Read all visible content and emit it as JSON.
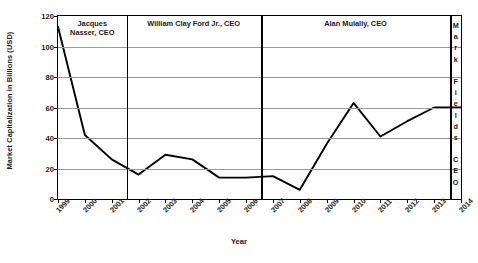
{
  "chart_data": {
    "type": "line",
    "title": "",
    "xlabel": "Year",
    "ylabel": "Market Capitalization in Billions (USD)",
    "categories": [
      "1999",
      "2000",
      "2001",
      "2002",
      "2003",
      "2004",
      "2005",
      "2006",
      "2007",
      "2008",
      "2009",
      "2010",
      "2011",
      "2012",
      "2013",
      "2014"
    ],
    "values": [
      113,
      42,
      26,
      16,
      29,
      26,
      14,
      14,
      15,
      6,
      36,
      63,
      41,
      51,
      60,
      60
    ],
    "series": [
      {
        "name": "Market Capitalization",
        "values": [
          113,
          42,
          26,
          16,
          29,
          26,
          14,
          14,
          15,
          6,
          36,
          63,
          41,
          51,
          60,
          60
        ]
      }
    ],
    "ylim": [
      0,
      120
    ],
    "yticks": [
      0,
      20,
      40,
      60,
      80,
      100,
      120
    ],
    "xlim": [
      "1999",
      "2014"
    ],
    "grid": "horizontal",
    "legend": "none",
    "line_color": "#000000",
    "grid_color": "#9a9a9a",
    "annotations": [
      {
        "label": "Jacques\nNasser, CEO",
        "display": "Jacques|Nasser, CEO",
        "orientation": "horizontal",
        "start": "1999",
        "end": "2001"
      },
      {
        "label": "William Clay Ford Jr., CEO",
        "display": "William Clay Ford Jr., CEO",
        "orientation": "horizontal",
        "start": "2001",
        "end": "2006"
      },
      {
        "label": "Alan Mulally, CEO",
        "display": "Alan Mulally, CEO",
        "orientation": "horizontal",
        "start": "2006",
        "end": "2013"
      },
      {
        "label": "Mark Fields, CEO",
        "display": "M|a|r|k| |F|i|e|l|d|s| |C|E|O",
        "orientation": "vertical",
        "start": "2013",
        "end": "2014"
      }
    ]
  },
  "axes": {
    "y_title": "Market Capitalization in Billions (USD)",
    "x_title": "Year",
    "y_ticks": [
      "0",
      "20",
      "40",
      "60",
      "80",
      "100",
      "120"
    ],
    "x_ticks": [
      "1999",
      "2000",
      "2001",
      "2002",
      "2003",
      "2004",
      "2005",
      "2006",
      "2007",
      "2008",
      "2009",
      "2010",
      "2011",
      "2012",
      "2013",
      "2014"
    ]
  },
  "ceo_segments": [
    {
      "id": "nasser",
      "line1": "Jacques",
      "line2": "Nasser, CEO"
    },
    {
      "id": "ford",
      "line1": "William Clay Ford Jr., CEO",
      "line2": ""
    },
    {
      "id": "mulally",
      "line1": "Alan Mulally, CEO",
      "line2": ""
    },
    {
      "id": "fields",
      "letters": [
        "M",
        "a",
        "r",
        "k",
        "",
        "F",
        "i",
        "e",
        "l",
        "d",
        "s",
        "",
        "C",
        "E",
        "O"
      ]
    }
  ]
}
